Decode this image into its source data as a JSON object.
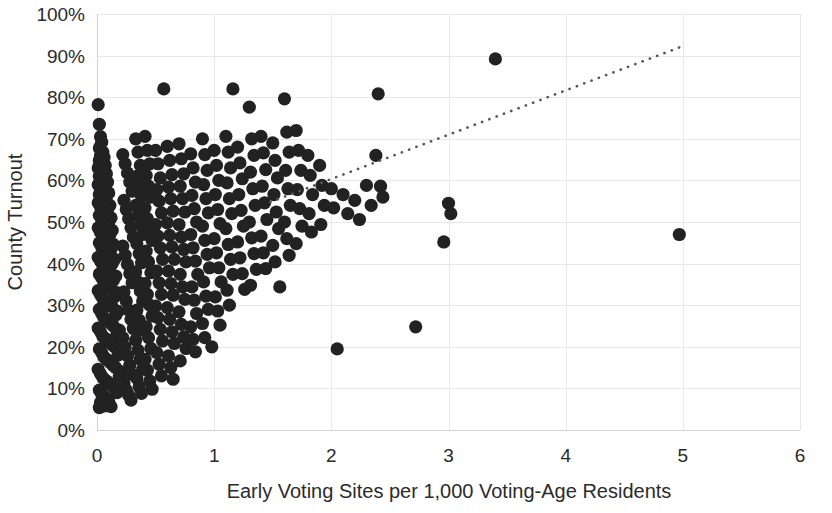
{
  "chart_data": {
    "type": "scatter",
    "title": "",
    "xlabel": "Early Voting Sites per 1,000 Voting-Age Residents",
    "ylabel": "County Turnout",
    "xlim": [
      0,
      6
    ],
    "ylim": [
      0,
      1.0
    ],
    "x_ticks": [
      0,
      1,
      2,
      3,
      4,
      5,
      6
    ],
    "x_tick_labels": [
      "0",
      "1",
      "2",
      "3",
      "4",
      "5",
      "6"
    ],
    "y_ticks": [
      0,
      0.1,
      0.2,
      0.3,
      0.4,
      0.5,
      0.6,
      0.7,
      0.8,
      0.9,
      1.0
    ],
    "y_tick_labels": [
      "0%",
      "10%",
      "20%",
      "30%",
      "40%",
      "50%",
      "60%",
      "70%",
      "80%",
      "90%",
      "100%"
    ],
    "grid": true,
    "grid_color": "#e8e8ea",
    "legend": false,
    "marker_color": "#222222",
    "marker_size": 9,
    "trendline": {
      "style": "dotted",
      "color": "#55565a",
      "x_start": 1.48,
      "y_start": 0.548,
      "x_end": 5.02,
      "y_end": 0.925
    },
    "points": [
      [
        0.01,
        0.782
      ],
      [
        0.02,
        0.735
      ],
      [
        0.03,
        0.705
      ],
      [
        0.04,
        0.692
      ],
      [
        0.02,
        0.678
      ],
      [
        0.05,
        0.668
      ],
      [
        0.03,
        0.66
      ],
      [
        0.06,
        0.655
      ],
      [
        0.02,
        0.648
      ],
      [
        0.04,
        0.64
      ],
      [
        0.07,
        0.636
      ],
      [
        0.01,
        0.63
      ],
      [
        0.05,
        0.625
      ],
      [
        0.03,
        0.62
      ],
      [
        0.08,
        0.616
      ],
      [
        0.02,
        0.61
      ],
      [
        0.06,
        0.605
      ],
      [
        0.04,
        0.6
      ],
      [
        0.09,
        0.596
      ],
      [
        0.01,
        0.59
      ],
      [
        0.07,
        0.586
      ],
      [
        0.03,
        0.58
      ],
      [
        0.05,
        0.575
      ],
      [
        0.1,
        0.57
      ],
      [
        0.02,
        0.566
      ],
      [
        0.08,
        0.56
      ],
      [
        0.04,
        0.555
      ],
      [
        0.06,
        0.55
      ],
      [
        0.01,
        0.546
      ],
      [
        0.11,
        0.54
      ],
      [
        0.03,
        0.536
      ],
      [
        0.09,
        0.53
      ],
      [
        0.05,
        0.525
      ],
      [
        0.07,
        0.52
      ],
      [
        0.02,
        0.516
      ],
      [
        0.12,
        0.51
      ],
      [
        0.04,
        0.505
      ],
      [
        0.1,
        0.5
      ],
      [
        0.06,
        0.496
      ],
      [
        0.08,
        0.49
      ],
      [
        0.01,
        0.486
      ],
      [
        0.13,
        0.48
      ],
      [
        0.03,
        0.475
      ],
      [
        0.11,
        0.47
      ],
      [
        0.05,
        0.466
      ],
      [
        0.07,
        0.46
      ],
      [
        0.09,
        0.455
      ],
      [
        0.02,
        0.45
      ],
      [
        0.14,
        0.446
      ],
      [
        0.04,
        0.44
      ],
      [
        0.12,
        0.435
      ],
      [
        0.06,
        0.43
      ],
      [
        0.08,
        0.426
      ],
      [
        0.1,
        0.42
      ],
      [
        0.01,
        0.415
      ],
      [
        0.15,
        0.41
      ],
      [
        0.03,
        0.406
      ],
      [
        0.13,
        0.4
      ],
      [
        0.05,
        0.395
      ],
      [
        0.07,
        0.39
      ],
      [
        0.09,
        0.386
      ],
      [
        0.11,
        0.38
      ],
      [
        0.02,
        0.375
      ],
      [
        0.16,
        0.37
      ],
      [
        0.04,
        0.366
      ],
      [
        0.14,
        0.36
      ],
      [
        0.06,
        0.355
      ],
      [
        0.08,
        0.35
      ],
      [
        0.1,
        0.346
      ],
      [
        0.12,
        0.34
      ],
      [
        0.01,
        0.335
      ],
      [
        0.17,
        0.33
      ],
      [
        0.03,
        0.325
      ],
      [
        0.15,
        0.32
      ],
      [
        0.05,
        0.316
      ],
      [
        0.07,
        0.31
      ],
      [
        0.09,
        0.305
      ],
      [
        0.11,
        0.3
      ],
      [
        0.13,
        0.296
      ],
      [
        0.02,
        0.29
      ],
      [
        0.18,
        0.285
      ],
      [
        0.04,
        0.28
      ],
      [
        0.16,
        0.276
      ],
      [
        0.06,
        0.27
      ],
      [
        0.08,
        0.265
      ],
      [
        0.1,
        0.26
      ],
      [
        0.12,
        0.256
      ],
      [
        0.14,
        0.25
      ],
      [
        0.01,
        0.245
      ],
      [
        0.19,
        0.24
      ],
      [
        0.03,
        0.236
      ],
      [
        0.17,
        0.23
      ],
      [
        0.05,
        0.225
      ],
      [
        0.07,
        0.22
      ],
      [
        0.09,
        0.216
      ],
      [
        0.11,
        0.21
      ],
      [
        0.13,
        0.205
      ],
      [
        0.15,
        0.2
      ],
      [
        0.02,
        0.195
      ],
      [
        0.2,
        0.19
      ],
      [
        0.04,
        0.186
      ],
      [
        0.18,
        0.18
      ],
      [
        0.06,
        0.175
      ],
      [
        0.08,
        0.17
      ],
      [
        0.1,
        0.166
      ],
      [
        0.12,
        0.16
      ],
      [
        0.14,
        0.155
      ],
      [
        0.16,
        0.15
      ],
      [
        0.01,
        0.146
      ],
      [
        0.21,
        0.14
      ],
      [
        0.03,
        0.135
      ],
      [
        0.19,
        0.13
      ],
      [
        0.05,
        0.126
      ],
      [
        0.07,
        0.12
      ],
      [
        0.09,
        0.116
      ],
      [
        0.11,
        0.11
      ],
      [
        0.13,
        0.105
      ],
      [
        0.15,
        0.1
      ],
      [
        0.02,
        0.096
      ],
      [
        0.17,
        0.09
      ],
      [
        0.04,
        0.086
      ],
      [
        0.06,
        0.08
      ],
      [
        0.08,
        0.076
      ],
      [
        0.1,
        0.07
      ],
      [
        0.03,
        0.066
      ],
      [
        0.05,
        0.062
      ],
      [
        0.07,
        0.058
      ],
      [
        0.12,
        0.056
      ],
      [
        0.02,
        0.054
      ],
      [
        0.22,
        0.662
      ],
      [
        0.24,
        0.64
      ],
      [
        0.26,
        0.618
      ],
      [
        0.28,
        0.596
      ],
      [
        0.3,
        0.574
      ],
      [
        0.23,
        0.552
      ],
      [
        0.25,
        0.53
      ],
      [
        0.27,
        0.508
      ],
      [
        0.29,
        0.486
      ],
      [
        0.31,
        0.464
      ],
      [
        0.22,
        0.442
      ],
      [
        0.24,
        0.42
      ],
      [
        0.26,
        0.398
      ],
      [
        0.28,
        0.376
      ],
      [
        0.3,
        0.354
      ],
      [
        0.23,
        0.332
      ],
      [
        0.25,
        0.31
      ],
      [
        0.27,
        0.288
      ],
      [
        0.29,
        0.266
      ],
      [
        0.31,
        0.244
      ],
      [
        0.22,
        0.222
      ],
      [
        0.24,
        0.2
      ],
      [
        0.26,
        0.178
      ],
      [
        0.28,
        0.156
      ],
      [
        0.3,
        0.134
      ],
      [
        0.23,
        0.112
      ],
      [
        0.25,
        0.096
      ],
      [
        0.27,
        0.084
      ],
      [
        0.29,
        0.072
      ],
      [
        0.33,
        0.7
      ],
      [
        0.35,
        0.668
      ],
      [
        0.37,
        0.636
      ],
      [
        0.34,
        0.61
      ],
      [
        0.36,
        0.588
      ],
      [
        0.38,
        0.562
      ],
      [
        0.33,
        0.54
      ],
      [
        0.35,
        0.516
      ],
      [
        0.37,
        0.494
      ],
      [
        0.39,
        0.47
      ],
      [
        0.34,
        0.448
      ],
      [
        0.36,
        0.424
      ],
      [
        0.38,
        0.402
      ],
      [
        0.33,
        0.38
      ],
      [
        0.35,
        0.356
      ],
      [
        0.37,
        0.334
      ],
      [
        0.39,
        0.31
      ],
      [
        0.34,
        0.288
      ],
      [
        0.36,
        0.264
      ],
      [
        0.38,
        0.24
      ],
      [
        0.33,
        0.216
      ],
      [
        0.35,
        0.192
      ],
      [
        0.37,
        0.17
      ],
      [
        0.39,
        0.146
      ],
      [
        0.34,
        0.124
      ],
      [
        0.36,
        0.104
      ],
      [
        0.38,
        0.088
      ],
      [
        0.41,
        0.706
      ],
      [
        0.43,
        0.672
      ],
      [
        0.45,
        0.64
      ],
      [
        0.42,
        0.612
      ],
      [
        0.44,
        0.586
      ],
      [
        0.46,
        0.56
      ],
      [
        0.41,
        0.534
      ],
      [
        0.43,
        0.508
      ],
      [
        0.45,
        0.482
      ],
      [
        0.47,
        0.456
      ],
      [
        0.42,
        0.43
      ],
      [
        0.44,
        0.404
      ],
      [
        0.46,
        0.378
      ],
      [
        0.41,
        0.352
      ],
      [
        0.43,
        0.326
      ],
      [
        0.45,
        0.3
      ],
      [
        0.47,
        0.274
      ],
      [
        0.42,
        0.248
      ],
      [
        0.44,
        0.222
      ],
      [
        0.46,
        0.196
      ],
      [
        0.41,
        0.17
      ],
      [
        0.43,
        0.144
      ],
      [
        0.45,
        0.118
      ],
      [
        0.47,
        0.098
      ],
      [
        0.5,
        0.672
      ],
      [
        0.52,
        0.64
      ],
      [
        0.54,
        0.606
      ],
      [
        0.51,
        0.578
      ],
      [
        0.53,
        0.55
      ],
      [
        0.55,
        0.522
      ],
      [
        0.5,
        0.494
      ],
      [
        0.52,
        0.466
      ],
      [
        0.54,
        0.438
      ],
      [
        0.56,
        0.41
      ],
      [
        0.51,
        0.382
      ],
      [
        0.53,
        0.354
      ],
      [
        0.55,
        0.326
      ],
      [
        0.5,
        0.298
      ],
      [
        0.52,
        0.27
      ],
      [
        0.54,
        0.242
      ],
      [
        0.56,
        0.214
      ],
      [
        0.51,
        0.186
      ],
      [
        0.53,
        0.158
      ],
      [
        0.55,
        0.13
      ],
      [
        0.57,
        0.82
      ],
      [
        0.6,
        0.682
      ],
      [
        0.62,
        0.648
      ],
      [
        0.64,
        0.614
      ],
      [
        0.61,
        0.584
      ],
      [
        0.63,
        0.556
      ],
      [
        0.65,
        0.526
      ],
      [
        0.6,
        0.498
      ],
      [
        0.62,
        0.468
      ],
      [
        0.64,
        0.44
      ],
      [
        0.66,
        0.41
      ],
      [
        0.61,
        0.382
      ],
      [
        0.63,
        0.352
      ],
      [
        0.65,
        0.324
      ],
      [
        0.6,
        0.294
      ],
      [
        0.62,
        0.266
      ],
      [
        0.64,
        0.236
      ],
      [
        0.66,
        0.208
      ],
      [
        0.61,
        0.178
      ],
      [
        0.63,
        0.15
      ],
      [
        0.65,
        0.122
      ],
      [
        0.7,
        0.688
      ],
      [
        0.72,
        0.652
      ],
      [
        0.74,
        0.616
      ],
      [
        0.71,
        0.586
      ],
      [
        0.73,
        0.556
      ],
      [
        0.75,
        0.524
      ],
      [
        0.7,
        0.494
      ],
      [
        0.72,
        0.464
      ],
      [
        0.74,
        0.434
      ],
      [
        0.76,
        0.404
      ],
      [
        0.71,
        0.374
      ],
      [
        0.73,
        0.344
      ],
      [
        0.75,
        0.314
      ],
      [
        0.7,
        0.284
      ],
      [
        0.72,
        0.254
      ],
      [
        0.74,
        0.224
      ],
      [
        0.76,
        0.196
      ],
      [
        0.71,
        0.166
      ],
      [
        0.8,
        0.664
      ],
      [
        0.82,
        0.63
      ],
      [
        0.84,
        0.596
      ],
      [
        0.81,
        0.564
      ],
      [
        0.83,
        0.532
      ],
      [
        0.85,
        0.5
      ],
      [
        0.8,
        0.47
      ],
      [
        0.82,
        0.438
      ],
      [
        0.84,
        0.406
      ],
      [
        0.86,
        0.374
      ],
      [
        0.81,
        0.344
      ],
      [
        0.83,
        0.312
      ],
      [
        0.85,
        0.28
      ],
      [
        0.8,
        0.248
      ],
      [
        0.82,
        0.218
      ],
      [
        0.84,
        0.188
      ],
      [
        0.9,
        0.7
      ],
      [
        0.92,
        0.662
      ],
      [
        0.94,
        0.624
      ],
      [
        0.91,
        0.59
      ],
      [
        0.93,
        0.556
      ],
      [
        0.95,
        0.522
      ],
      [
        0.9,
        0.49
      ],
      [
        0.92,
        0.456
      ],
      [
        0.94,
        0.422
      ],
      [
        0.96,
        0.39
      ],
      [
        0.91,
        0.356
      ],
      [
        0.93,
        0.322
      ],
      [
        0.95,
        0.29
      ],
      [
        0.9,
        0.256
      ],
      [
        0.92,
        0.222
      ],
      [
        0.98,
        0.2
      ],
      [
        1.0,
        0.672
      ],
      [
        1.02,
        0.636
      ],
      [
        1.04,
        0.6
      ],
      [
        1.01,
        0.566
      ],
      [
        1.03,
        0.53
      ],
      [
        1.05,
        0.496
      ],
      [
        1.0,
        0.46
      ],
      [
        1.02,
        0.426
      ],
      [
        1.04,
        0.39
      ],
      [
        1.06,
        0.356
      ],
      [
        1.01,
        0.32
      ],
      [
        1.03,
        0.286
      ],
      [
        1.05,
        0.252
      ],
      [
        1.1,
        0.706
      ],
      [
        1.12,
        0.668
      ],
      [
        1.14,
        0.63
      ],
      [
        1.11,
        0.594
      ],
      [
        1.13,
        0.556
      ],
      [
        1.15,
        0.52
      ],
      [
        1.1,
        0.484
      ],
      [
        1.12,
        0.446
      ],
      [
        1.14,
        0.41
      ],
      [
        1.16,
        0.374
      ],
      [
        1.11,
        0.336
      ],
      [
        1.13,
        0.3
      ],
      [
        1.16,
        0.82
      ],
      [
        1.2,
        0.68
      ],
      [
        1.22,
        0.642
      ],
      [
        1.24,
        0.604
      ],
      [
        1.21,
        0.566
      ],
      [
        1.23,
        0.528
      ],
      [
        1.25,
        0.49
      ],
      [
        1.2,
        0.452
      ],
      [
        1.22,
        0.414
      ],
      [
        1.24,
        0.376
      ],
      [
        1.26,
        0.338
      ],
      [
        1.3,
        0.776
      ],
      [
        1.32,
        0.7
      ],
      [
        1.34,
        0.66
      ],
      [
        1.31,
        0.62
      ],
      [
        1.33,
        0.58
      ],
      [
        1.35,
        0.54
      ],
      [
        1.3,
        0.5
      ],
      [
        1.32,
        0.462
      ],
      [
        1.34,
        0.424
      ],
      [
        1.36,
        0.386
      ],
      [
        1.31,
        0.348
      ],
      [
        1.4,
        0.706
      ],
      [
        1.42,
        0.666
      ],
      [
        1.44,
        0.626
      ],
      [
        1.41,
        0.586
      ],
      [
        1.43,
        0.546
      ],
      [
        1.45,
        0.506
      ],
      [
        1.4,
        0.466
      ],
      [
        1.42,
        0.426
      ],
      [
        1.44,
        0.388
      ],
      [
        1.5,
        0.69
      ],
      [
        1.52,
        0.648
      ],
      [
        1.54,
        0.606
      ],
      [
        1.51,
        0.566
      ],
      [
        1.53,
        0.524
      ],
      [
        1.55,
        0.484
      ],
      [
        1.5,
        0.444
      ],
      [
        1.52,
        0.404
      ],
      [
        1.56,
        0.344
      ],
      [
        1.6,
        0.796
      ],
      [
        1.62,
        0.716
      ],
      [
        1.64,
        0.668
      ],
      [
        1.61,
        0.624
      ],
      [
        1.63,
        0.58
      ],
      [
        1.65,
        0.54
      ],
      [
        1.6,
        0.5
      ],
      [
        1.62,
        0.46
      ],
      [
        1.64,
        0.42
      ],
      [
        1.7,
        0.72
      ],
      [
        1.72,
        0.672
      ],
      [
        1.74,
        0.624
      ],
      [
        1.71,
        0.578
      ],
      [
        1.73,
        0.532
      ],
      [
        1.75,
        0.49
      ],
      [
        1.7,
        0.448
      ],
      [
        1.8,
        0.66
      ],
      [
        1.82,
        0.612
      ],
      [
        1.84,
        0.566
      ],
      [
        1.81,
        0.52
      ],
      [
        1.83,
        0.476
      ],
      [
        1.9,
        0.636
      ],
      [
        1.92,
        0.588
      ],
      [
        1.94,
        0.54
      ],
      [
        1.91,
        0.494
      ],
      [
        2.0,
        0.58
      ],
      [
        2.02,
        0.534
      ],
      [
        2.05,
        0.195
      ],
      [
        2.1,
        0.566
      ],
      [
        2.14,
        0.52
      ],
      [
        2.2,
        0.552
      ],
      [
        2.24,
        0.506
      ],
      [
        2.3,
        0.588
      ],
      [
        2.34,
        0.54
      ],
      [
        2.38,
        0.66
      ],
      [
        2.4,
        0.808
      ],
      [
        2.42,
        0.586
      ],
      [
        2.44,
        0.56
      ],
      [
        2.72,
        0.248
      ],
      [
        2.96,
        0.452
      ],
      [
        3.0,
        0.545
      ],
      [
        3.02,
        0.52
      ],
      [
        3.4,
        0.892
      ],
      [
        4.97,
        0.47
      ]
    ]
  },
  "axes": {
    "x_title": "Early Voting Sites per 1,000 Voting-Age Residents",
    "y_title": "County Turnout"
  }
}
